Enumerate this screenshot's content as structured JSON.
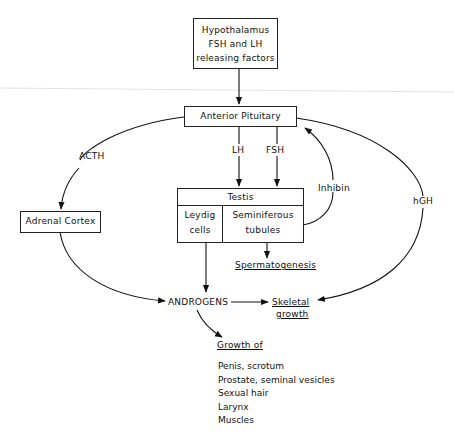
{
  "diagram": {
    "nodes": {
      "hypothalamus": {
        "lines": [
          "Hypothalamus",
          "FSH and LH",
          "releasing factors"
        ]
      },
      "anterior_pituitary": {
        "label": "Anterior Pituitary"
      },
      "testis": {
        "header": "Testis",
        "left_cell": [
          "Leydig",
          "cells"
        ],
        "right_cell": [
          "Seminiferous",
          "tubules"
        ]
      },
      "adrenal_cortex": {
        "label": "Adrenal Cortex"
      },
      "androgens": {
        "label": "ANDROGENS"
      },
      "skeletal_growth": {
        "lines": [
          "Skeletal",
          "growth"
        ]
      },
      "spermatogenesis": {
        "label": "Spermatogenesis"
      },
      "growth_of": {
        "title": "Growth of",
        "items": [
          "Penis, scrotum",
          "Prostate, seminal vesicles",
          "Sexual hair",
          "Larynx",
          "Muscles"
        ]
      }
    },
    "edge_labels": {
      "acth": "ACTH",
      "lh": "LH",
      "fsh": "FSH",
      "inhibin": "Inhibin",
      "hgh": "hGH"
    },
    "edges": [
      {
        "from": "Hypothalamus",
        "to": "Anterior Pituitary"
      },
      {
        "from": "Anterior Pituitary",
        "to": "Testis",
        "label": "LH"
      },
      {
        "from": "Anterior Pituitary",
        "to": "Testis",
        "label": "FSH"
      },
      {
        "from": "Anterior Pituitary",
        "to": "Adrenal Cortex",
        "label": "ACTH"
      },
      {
        "from": "Anterior Pituitary",
        "to": "Skeletal growth",
        "label": "hGH"
      },
      {
        "from": "Seminiferous tubules",
        "to": "Anterior Pituitary",
        "label": "Inhibin"
      },
      {
        "from": "Seminiferous tubules",
        "to": "Spermatogenesis"
      },
      {
        "from": "Leydig cells",
        "to": "ANDROGENS"
      },
      {
        "from": "Adrenal Cortex",
        "to": "ANDROGENS"
      },
      {
        "from": "ANDROGENS",
        "to": "Skeletal growth"
      },
      {
        "from": "ANDROGENS",
        "to": "Growth of"
      }
    ]
  }
}
